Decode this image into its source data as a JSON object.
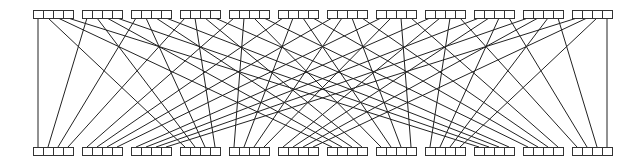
{
  "diagram": {
    "type": "permutation-network",
    "groups": 12,
    "cells_per_group": 4,
    "layout": {
      "width": 642,
      "height": 164,
      "first_group_x": 33,
      "group_pitch": 49,
      "cell_width": 10,
      "cell_height": 8,
      "top_row_y": 10,
      "bottom_row_y": 147
    },
    "mapping_rule": "top index i = 4*g + k connects to bottom index j = 12*k + g",
    "colors": {
      "stroke": "#333333",
      "wire": "#222222",
      "background": "#ffffff"
    }
  }
}
